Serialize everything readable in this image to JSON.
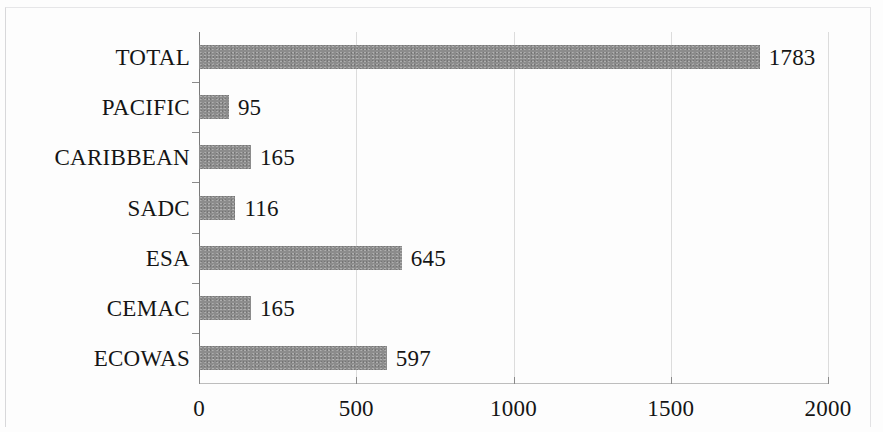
{
  "chart_data": {
    "type": "bar",
    "orientation": "horizontal",
    "title": "",
    "xlabel": "",
    "ylabel": "",
    "categories": [
      "TOTAL",
      "PACIFIC",
      "CARIBBEAN",
      "SADC",
      "ESA",
      "CEMAC",
      "ECOWAS"
    ],
    "values": [
      1783,
      95,
      165,
      116,
      645,
      165,
      597
    ],
    "value_labels": [
      "1783",
      "95",
      "165",
      "116",
      "645",
      "165",
      "597"
    ],
    "xlim": [
      0,
      2000
    ],
    "xticks": [
      0,
      500,
      1000,
      1500,
      2000
    ],
    "xtick_labels": [
      "0",
      "500",
      "1000",
      "1500",
      "2000"
    ],
    "grid": true,
    "legend": false,
    "bar_color": "#8c8c8c",
    "axis_color": "#7a7a7a",
    "grid_color": "#dcdcdc",
    "text_color": "#151515"
  }
}
